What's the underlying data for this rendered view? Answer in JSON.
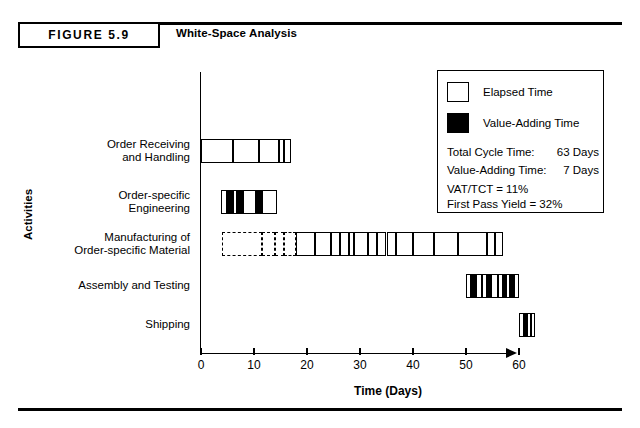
{
  "figure": {
    "tag": "FIGURE 5.9",
    "title": "White-Space Analysis"
  },
  "legend": {
    "elapsed_swatch_name": "elapsed-time-swatch",
    "elapsed_label": "Elapsed Time",
    "vat_swatch_name": "value-adding-time-swatch",
    "vat_label": "Value-Adding Time",
    "stats": [
      {
        "label": "Total Cycle Time:",
        "value": "63 Days"
      },
      {
        "label": "Value-Adding Time:",
        "value": "7 Days"
      }
    ],
    "notes": [
      "VAT/TCT = 11%",
      "First Pass Yield = 32%"
    ]
  },
  "chart_data": {
    "type": "bar",
    "subtype": "gantt-white-space-analysis",
    "title": "White-Space Analysis",
    "xlabel": "Time (Days)",
    "ylabel": "Activities",
    "xlim": [
      0,
      63
    ],
    "xticks": [
      0,
      10,
      20,
      30,
      40,
      50,
      60
    ],
    "xtick_labels": [
      "0",
      "10",
      "20",
      "30",
      "40",
      "50",
      "60"
    ],
    "grid": false,
    "legend_position": "top-right",
    "units": "days",
    "summary": {
      "total_cycle_time_days": 63,
      "value_adding_time_days": 7,
      "vat_over_tct_percent": 11,
      "first_pass_yield_percent": 32
    },
    "categories": [
      "Order Receiving and Handling",
      "Order-specific Engineering",
      "Manufacturing of Order-specific Material",
      "Assembly and Testing",
      "Shipping"
    ],
    "category_lines": [
      [
        "Order Receiving",
        "and Handling"
      ],
      [
        "Order-specific",
        "Engineering"
      ],
      [
        "Manufacturing of",
        "Order-specific Material"
      ],
      [
        "Assembly and Testing"
      ],
      [
        "Shipping"
      ]
    ],
    "series": [
      {
        "name": "Elapsed Time",
        "kind": "elapsed",
        "color": "#ffffff"
      },
      {
        "name": "Value-Adding Time",
        "kind": "value_adding",
        "color": "#000000"
      }
    ],
    "bars": [
      {
        "activity": "Order Receiving and Handling",
        "start": 0,
        "end": 17,
        "segments": [
          {
            "start": 0,
            "end": 6.0,
            "kind": "elapsed"
          },
          {
            "start": 6.0,
            "end": 11.0,
            "kind": "elapsed"
          },
          {
            "start": 11.0,
            "end": 14.7,
            "kind": "elapsed"
          },
          {
            "start": 14.7,
            "end": 15.6,
            "kind": "elapsed"
          },
          {
            "start": 15.6,
            "end": 17.0,
            "kind": "elapsed"
          }
        ]
      },
      {
        "activity": "Order-specific Engineering",
        "start": 3.8,
        "end": 14.3,
        "segments": [
          {
            "start": 3.8,
            "end": 4.9,
            "kind": "elapsed"
          },
          {
            "start": 4.9,
            "end": 6.0,
            "kind": "value_adding"
          },
          {
            "start": 6.0,
            "end": 6.8,
            "kind": "elapsed"
          },
          {
            "start": 6.8,
            "end": 7.9,
            "kind": "value_adding"
          },
          {
            "start": 7.9,
            "end": 10.4,
            "kind": "elapsed"
          },
          {
            "start": 10.4,
            "end": 11.5,
            "kind": "value_adding"
          },
          {
            "start": 11.5,
            "end": 14.3,
            "kind": "elapsed"
          }
        ]
      },
      {
        "activity": "Manufacturing of Order-specific Material",
        "start": 4.0,
        "end": 57.0,
        "segments": [
          {
            "start": 4.0,
            "end": 11.5,
            "kind": "dashed"
          },
          {
            "start": 11.5,
            "end": 14.0,
            "kind": "dashed"
          },
          {
            "start": 14.0,
            "end": 15.6,
            "kind": "dashed"
          },
          {
            "start": 15.6,
            "end": 18.0,
            "kind": "dashed"
          },
          {
            "start": 18.0,
            "end": 21.5,
            "kind": "elapsed"
          },
          {
            "start": 21.5,
            "end": 24.5,
            "kind": "elapsed"
          },
          {
            "start": 24.5,
            "end": 26.2,
            "kind": "elapsed"
          },
          {
            "start": 26.2,
            "end": 28.0,
            "kind": "elapsed"
          },
          {
            "start": 28.0,
            "end": 28.8,
            "kind": "elapsed"
          },
          {
            "start": 28.8,
            "end": 31.5,
            "kind": "elapsed"
          },
          {
            "start": 31.5,
            "end": 33.3,
            "kind": "elapsed"
          },
          {
            "start": 33.3,
            "end": 35.0,
            "kind": "elapsed"
          },
          {
            "start": 35.0,
            "end": 36.8,
            "kind": "elapsed"
          },
          {
            "start": 36.8,
            "end": 40.0,
            "kind": "elapsed"
          },
          {
            "start": 40.0,
            "end": 44.0,
            "kind": "elapsed"
          },
          {
            "start": 44.0,
            "end": 48.5,
            "kind": "elapsed"
          },
          {
            "start": 48.5,
            "end": 54.0,
            "kind": "elapsed"
          },
          {
            "start": 54.0,
            "end": 55.5,
            "kind": "elapsed"
          },
          {
            "start": 55.5,
            "end": 57.0,
            "kind": "elapsed"
          }
        ]
      },
      {
        "activity": "Assembly and Testing",
        "start": 50.0,
        "end": 60.0,
        "segments": [
          {
            "start": 50.0,
            "end": 51.0,
            "kind": "elapsed"
          },
          {
            "start": 51.0,
            "end": 51.8,
            "kind": "value_adding"
          },
          {
            "start": 51.8,
            "end": 53.0,
            "kind": "elapsed"
          },
          {
            "start": 53.0,
            "end": 54.0,
            "kind": "elapsed"
          },
          {
            "start": 54.0,
            "end": 54.8,
            "kind": "value_adding"
          },
          {
            "start": 54.8,
            "end": 56.0,
            "kind": "elapsed"
          },
          {
            "start": 56.0,
            "end": 57.0,
            "kind": "elapsed"
          },
          {
            "start": 57.0,
            "end": 57.6,
            "kind": "value_adding"
          },
          {
            "start": 57.6,
            "end": 58.3,
            "kind": "elapsed"
          },
          {
            "start": 58.3,
            "end": 59.0,
            "kind": "value_adding"
          },
          {
            "start": 59.0,
            "end": 60.0,
            "kind": "elapsed"
          }
        ]
      },
      {
        "activity": "Shipping",
        "start": 60.0,
        "end": 63.0,
        "segments": [
          {
            "start": 60.0,
            "end": 61.0,
            "kind": "elapsed"
          },
          {
            "start": 61.0,
            "end": 61.5,
            "kind": "value_adding"
          },
          {
            "start": 61.5,
            "end": 62.2,
            "kind": "elapsed"
          },
          {
            "start": 62.2,
            "end": 63.0,
            "kind": "elapsed"
          }
        ]
      }
    ]
  }
}
